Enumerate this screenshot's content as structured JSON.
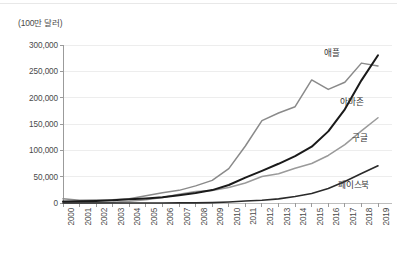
{
  "chart_data": {
    "type": "line",
    "title": "",
    "subtitle": "",
    "ylabel": "(100만 달러)",
    "xlabel": "",
    "ylim": [
      0,
      300000
    ],
    "ytick_step": 50000,
    "grid": true,
    "legend_position": "inline-right",
    "categories": [
      "2000",
      "2001",
      "2002",
      "2003",
      "2004",
      "2005",
      "2006",
      "2007",
      "2008",
      "2009",
      "2010",
      "2011",
      "2012",
      "2013",
      "2014",
      "2015",
      "2016",
      "2017",
      "2018",
      "2019"
    ],
    "ytick_labels": [
      "0",
      "50,000",
      "100,000",
      "150,000",
      "200,000",
      "250,000",
      "300,000"
    ],
    "ytick_values": [
      0,
      50000,
      100000,
      150000,
      200000,
      250000,
      300000
    ],
    "series": [
      {
        "name": "애플",
        "color": "#8a8a8a",
        "label_x_year": "2017",
        "values": [
          7983,
          5363,
          5742,
          6207,
          8279,
          13931,
          19315,
          24006,
          32479,
          42905,
          65225,
          108249,
          156508,
          170910,
          182795,
          233715,
          215639,
          229234,
          265595,
          260174
        ]
      },
      {
        "name": "아마존",
        "color": "#1a1a1a",
        "label_x_year": "2017",
        "values": [
          2762,
          3122,
          3933,
          5264,
          6921,
          8490,
          10711,
          14835,
          19166,
          24509,
          34204,
          48077,
          61093,
          74452,
          88988,
          107006,
          135987,
          177866,
          232887,
          280522
        ]
      },
      {
        "name": "구글",
        "color": "#9a9a9a",
        "label_x_year": "2017",
        "values": [
          19,
          86,
          440,
          1466,
          3189,
          6139,
          10605,
          16594,
          21796,
          23651,
          29321,
          37905,
          50175,
          55519,
          66001,
          74989,
          90272,
          110855,
          136819,
          161857
        ]
      },
      {
        "name": "페이스북",
        "color": "#2a2a2a",
        "label_x_year": "2017",
        "values": [
          0,
          0,
          0,
          0,
          0,
          0,
          0,
          153,
          272,
          777,
          1974,
          3711,
          5089,
          7872,
          12466,
          17928,
          27638,
          40653,
          55838,
          70697
        ]
      }
    ]
  },
  "labels": {
    "apple": "애플",
    "amazon": "아마존",
    "google": "구글",
    "facebook": "페이스북"
  }
}
